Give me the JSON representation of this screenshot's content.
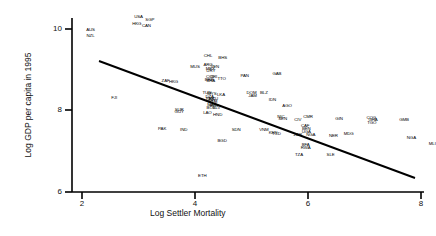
{
  "figure": {
    "xlabel": "Log Settler Mortality",
    "ylabel": "Log GDP per capita in 1995",
    "yticks": [
      "10",
      "8",
      "6"
    ],
    "xticks": [
      "2",
      "4",
      "6",
      "8"
    ],
    "axis_color": "#000000",
    "line_color": "#000000",
    "text_color": "#000000",
    "background": "#ffffff"
  },
  "chart_data": {
    "type": "scatter",
    "title": "",
    "xlabel": "Log Settler Mortality",
    "ylabel": "Log GDP per capita in 1995",
    "xlim": [
      1.6,
      8.4
    ],
    "ylim": [
      5.6,
      10.6
    ],
    "xticks": [
      2,
      4,
      6,
      8
    ],
    "yticks": [
      6,
      8,
      10
    ],
    "grid": false,
    "legend": null,
    "fit_line": {
      "type": "linear",
      "x": [
        2.3,
        8.1
      ],
      "y": [
        9.33,
        6.57
      ],
      "slope": -0.476,
      "intercept": 10.43
    },
    "point_label_key": "country_code",
    "points": [
      {
        "label": "AUS",
        "x": 2.15,
        "y": 9.98
      },
      {
        "label": "NZL",
        "x": 2.15,
        "y": 9.83
      },
      {
        "label": "USA",
        "x": 3.0,
        "y": 10.3
      },
      {
        "label": "SGP",
        "x": 3.2,
        "y": 10.22
      },
      {
        "label": "HKG",
        "x": 2.97,
        "y": 10.13
      },
      {
        "label": "CAN",
        "x": 3.14,
        "y": 10.07
      },
      {
        "label": "CHL",
        "x": 4.23,
        "y": 9.33
      },
      {
        "label": "BHS",
        "x": 4.49,
        "y": 9.3
      },
      {
        "label": "ARG",
        "x": 4.23,
        "y": 9.12
      },
      {
        "label": "VEN",
        "x": 4.35,
        "y": 9.08
      },
      {
        "label": "MEX",
        "x": 4.27,
        "y": 9.02
      },
      {
        "label": "URY",
        "x": 4.28,
        "y": 8.97
      },
      {
        "label": "COL",
        "x": 4.27,
        "y": 8.83
      },
      {
        "label": "CRI",
        "x": 4.33,
        "y": 8.82
      },
      {
        "label": "BRB",
        "x": 4.25,
        "y": 8.76
      },
      {
        "label": "TTO",
        "x": 4.47,
        "y": 8.78
      },
      {
        "label": "BRA",
        "x": 4.28,
        "y": 8.73
      },
      {
        "label": "MUS",
        "x": 4.0,
        "y": 9.07
      },
      {
        "label": "PAN",
        "x": 4.88,
        "y": 8.86
      },
      {
        "label": "GAB",
        "x": 5.45,
        "y": 8.9
      },
      {
        "label": "ZAF",
        "x": 3.48,
        "y": 8.73
      },
      {
        "label": "HKG2",
        "x": 3.62,
        "y": 8.7
      },
      {
        "label": "FJI",
        "x": 2.57,
        "y": 8.3
      },
      {
        "label": "TUN",
        "x": 4.21,
        "y": 8.43
      },
      {
        "label": "MYS",
        "x": 4.3,
        "y": 8.41
      },
      {
        "label": "LKA",
        "x": 4.46,
        "y": 8.37
      },
      {
        "label": "DZA",
        "x": 4.26,
        "y": 8.34
      },
      {
        "label": "PER",
        "x": 4.27,
        "y": 8.29
      },
      {
        "label": "ECU",
        "x": 4.33,
        "y": 8.29
      },
      {
        "label": "PRY",
        "x": 4.3,
        "y": 8.24
      },
      {
        "label": "GTM",
        "x": 4.31,
        "y": 8.21
      },
      {
        "label": "MAR",
        "x": 4.3,
        "y": 8.13
      },
      {
        "label": "EGY",
        "x": 4.34,
        "y": 8.1
      },
      {
        "label": "SLV",
        "x": 4.38,
        "y": 8.07
      },
      {
        "label": "BOL",
        "x": 4.28,
        "y": 8.06
      },
      {
        "label": "DOM",
        "x": 5.0,
        "y": 8.44
      },
      {
        "label": "BLZ",
        "x": 5.22,
        "y": 8.44
      },
      {
        "label": "JAM",
        "x": 5.02,
        "y": 8.36
      },
      {
        "label": "IDN",
        "x": 5.37,
        "y": 8.27
      },
      {
        "label": "AGO",
        "x": 5.63,
        "y": 8.1
      },
      {
        "label": "SUR",
        "x": 3.72,
        "y": 8.02
      },
      {
        "label": "GUY",
        "x": 3.72,
        "y": 7.96
      },
      {
        "label": "LAO",
        "x": 4.22,
        "y": 7.93
      },
      {
        "label": "HND",
        "x": 4.4,
        "y": 7.9
      },
      {
        "label": "NIC",
        "x": 5.52,
        "y": 7.85
      },
      {
        "label": "SEN",
        "x": 5.55,
        "y": 7.79
      },
      {
        "label": "CIV",
        "x": 5.82,
        "y": 7.78
      },
      {
        "label": "CMR",
        "x": 6.0,
        "y": 7.83
      },
      {
        "label": "GIN",
        "x": 6.55,
        "y": 7.8
      },
      {
        "label": "COG",
        "x": 7.12,
        "y": 7.81
      },
      {
        "label": "GHA",
        "x": 7.15,
        "y": 7.76
      },
      {
        "label": "TGO",
        "x": 7.13,
        "y": 7.69
      },
      {
        "label": "GMB",
        "x": 7.7,
        "y": 7.76
      },
      {
        "label": "PAK",
        "x": 3.42,
        "y": 7.55
      },
      {
        "label": "IND",
        "x": 3.8,
        "y": 7.53
      },
      {
        "label": "SDN",
        "x": 4.73,
        "y": 7.52
      },
      {
        "label": "VNM",
        "x": 5.22,
        "y": 7.52
      },
      {
        "label": "KEN",
        "x": 5.38,
        "y": 7.45
      },
      {
        "label": "TCD",
        "x": 5.44,
        "y": 7.42
      },
      {
        "label": "CAF",
        "x": 5.95,
        "y": 7.62
      },
      {
        "label": "BEN",
        "x": 5.97,
        "y": 7.55
      },
      {
        "label": "UGA",
        "x": 5.97,
        "y": 7.48
      },
      {
        "label": "ZAR",
        "x": 5.82,
        "y": 7.41
      },
      {
        "label": "NGA2",
        "x": 6.05,
        "y": 7.41
      },
      {
        "label": "NER",
        "x": 6.45,
        "y": 7.38
      },
      {
        "label": "MDG",
        "x": 6.72,
        "y": 7.42
      },
      {
        "label": "NGA",
        "x": 7.83,
        "y": 7.32
      },
      {
        "label": "MLI",
        "x": 8.2,
        "y": 7.18
      },
      {
        "label": "BGD",
        "x": 4.48,
        "y": 7.25
      },
      {
        "label": "BFA",
        "x": 5.96,
        "y": 7.15
      },
      {
        "label": "RWA",
        "x": 5.96,
        "y": 7.09
      },
      {
        "label": "TZA",
        "x": 5.84,
        "y": 6.9
      },
      {
        "label": "SLE",
        "x": 6.4,
        "y": 6.9
      },
      {
        "label": "ETH",
        "x": 4.13,
        "y": 6.4
      }
    ]
  }
}
